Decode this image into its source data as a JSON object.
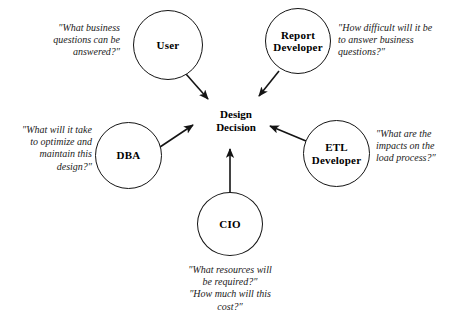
{
  "diagram": {
    "background_color": "#ffffff",
    "stroke_color": "#141414",
    "center": {
      "label": "Design\nDecision"
    },
    "nodes": [
      {
        "id": "user",
        "label": "User"
      },
      {
        "id": "report-developer",
        "label": "Report\nDeveloper"
      },
      {
        "id": "dba",
        "label": "DBA"
      },
      {
        "id": "etl-developer",
        "label": "ETL\nDeveloper"
      },
      {
        "id": "cio",
        "label": "CIO"
      }
    ],
    "quotes": [
      {
        "id": "user",
        "text": "″What business\nquestions can be\nanswered?″"
      },
      {
        "id": "report-developer",
        "text": "″How difficult will it be\nto answer business\nquestions?″"
      },
      {
        "id": "dba",
        "text": "″What will it take\nto optimize and\nmaintain this\ndesign?″"
      },
      {
        "id": "etl-developer",
        "text": "″What are the\nimpacts on the\nload process?″"
      },
      {
        "id": "cio",
        "text": "″What resources will\nbe required?″\n″How much will this\ncost?″"
      }
    ]
  }
}
